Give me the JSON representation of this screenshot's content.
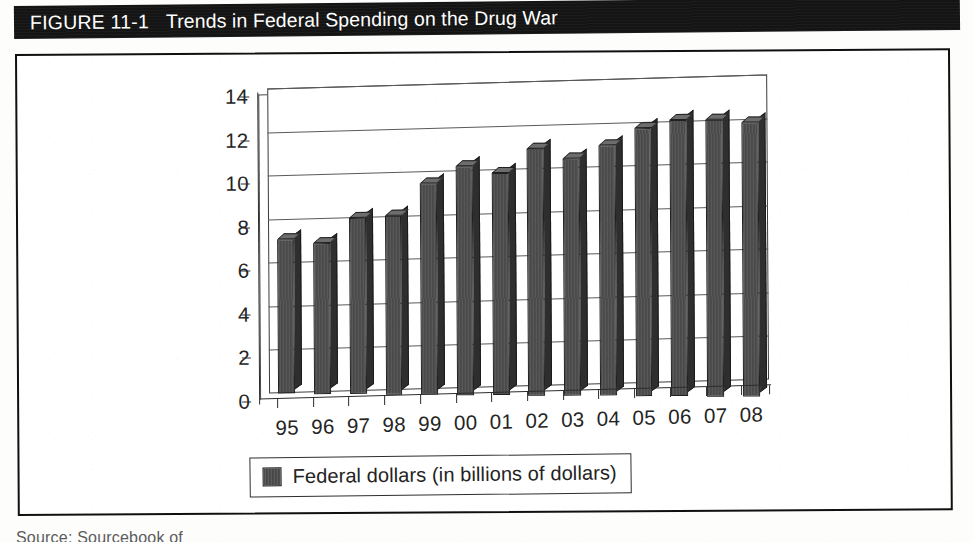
{
  "figure": {
    "number": "FIGURE 11-1",
    "title": "Trends in Federal Spending on the Drug War",
    "source_note": "Source: Sourcebook of"
  },
  "colors": {
    "title_bar_background": "#141414",
    "title_text": "#ffffff",
    "bar_fill": "#4d4d4d",
    "bar_side": "#2e2e2e",
    "bar_top": "#6d6d6d",
    "axis": "#2c2c2c",
    "gridline": "#5a5a5a",
    "frame": "#101010",
    "page_background": "#ffffff"
  },
  "legend": {
    "position": "bottom",
    "entries": [
      {
        "label": "Federal dollars (in billions of dollars)",
        "swatch": "bar-fill-swatch"
      }
    ]
  },
  "chart_data": {
    "type": "bar",
    "title": "Trends in Federal Spending on the Drug War",
    "xlabel": "",
    "ylabel": "",
    "ylim": [
      0,
      14
    ],
    "yticks": [
      0,
      2,
      4,
      6,
      8,
      10,
      12,
      14
    ],
    "ytick_labels": [
      "0",
      "2",
      "4",
      "6",
      "8",
      "10",
      "12",
      "14"
    ],
    "grid": true,
    "legend_position": "bottom",
    "categories": [
      "95",
      "96",
      "97",
      "98",
      "99",
      "00",
      "01",
      "02",
      "03",
      "04",
      "05",
      "06",
      "07",
      "08"
    ],
    "series": [
      {
        "name": "Federal dollars (in billions of dollars)",
        "values": [
          7.1,
          6.9,
          8.1,
          8.2,
          9.7,
          10.5,
          10.2,
          11.3,
          10.9,
          11.5,
          12.3,
          12.7,
          12.7,
          12.6
        ]
      }
    ]
  }
}
